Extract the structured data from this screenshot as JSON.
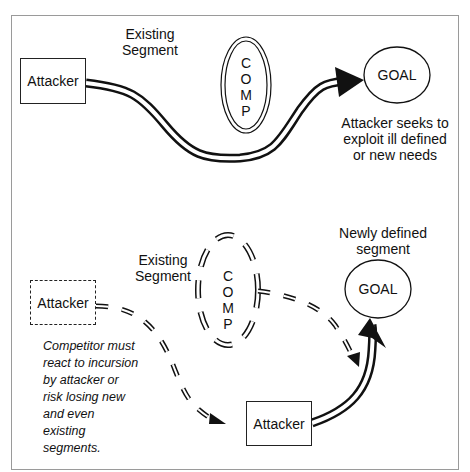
{
  "top_panel": {
    "attacker_label": "Attacker",
    "segment_label_line1": "Existing",
    "segment_label_line2": "Segment",
    "comp_letters": [
      "C",
      "O",
      "M",
      "P"
    ],
    "goal_label": "GOAL",
    "caption_line1": "Attacker seeks to",
    "caption_line2": "exploit ill defined",
    "caption_line3": "or new needs"
  },
  "bottom_panel": {
    "attacker_dashed_label": "Attacker",
    "segment_label_line1": "Existing",
    "segment_label_line2": "Segment",
    "comp_letters": [
      "C",
      "O",
      "M",
      "P"
    ],
    "new_segment_line1": "Newly defined",
    "new_segment_line2": "segment",
    "goal_label": "GOAL",
    "attacker_label": "Attacker",
    "note": "Competitor must\nreact to incursion\nby attacker or\nrisk losing new\nand even\nexisting\nsegments."
  },
  "colors": {
    "stroke": "#111111",
    "frame": "#9a9a9a",
    "background": "#ffffff"
  }
}
